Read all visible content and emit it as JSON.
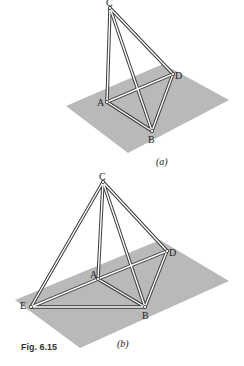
{
  "figure": {
    "caption": "Fig. 6.15",
    "colors": {
      "plane": "#b9b9b9",
      "rod_outline": "#3a3a3a",
      "rod_fill": "#ffffff"
    },
    "panels": [
      {
        "id": "a",
        "label": "(a)",
        "vertices": [
          {
            "name": "C",
            "label": "C"
          },
          {
            "name": "A",
            "label": "A"
          },
          {
            "name": "D",
            "label": "D"
          },
          {
            "name": "B",
            "label": "B"
          }
        ],
        "edges": [
          "CA",
          "CB",
          "CD",
          "AD",
          "AB",
          "BD"
        ]
      },
      {
        "id": "b",
        "label": "(b)",
        "vertices": [
          {
            "name": "C",
            "label": "C"
          },
          {
            "name": "A",
            "label": "A"
          },
          {
            "name": "D",
            "label": "D"
          },
          {
            "name": "B",
            "label": "B"
          },
          {
            "name": "E",
            "label": "E"
          }
        ],
        "edges": [
          "CE",
          "CA",
          "CB",
          "CD",
          "EA",
          "AD",
          "EB",
          "AB",
          "BD"
        ]
      }
    ]
  }
}
